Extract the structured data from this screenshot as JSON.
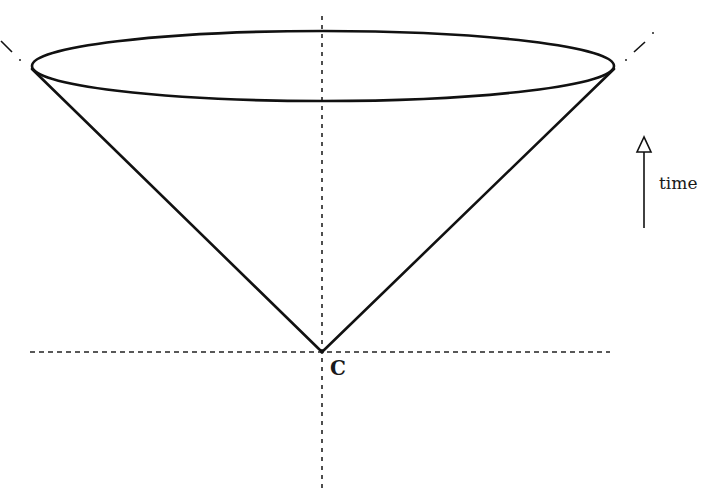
{
  "diagram": {
    "type": "light-cone",
    "labels": {
      "apex": "C",
      "time_axis": "time"
    },
    "colors": {
      "line": "#111111",
      "dashed": "#222222",
      "background": "#ffffff"
    },
    "geometry": {
      "apex": [
        322,
        352
      ],
      "ellipse": {
        "cx": 323,
        "cy": 67,
        "rx": 292,
        "ry": 35
      },
      "cone_left_tip": [
        31,
        68
      ],
      "cone_right_tip": [
        615,
        68
      ],
      "horizontal_axis": {
        "y": 352,
        "x1": 30,
        "x2": 610
      },
      "vertical_axis": {
        "x": 322,
        "y1": 16,
        "y2": 492
      },
      "time_arrow": {
        "x": 644,
        "y_top": 137,
        "y_bottom": 228
      }
    }
  }
}
